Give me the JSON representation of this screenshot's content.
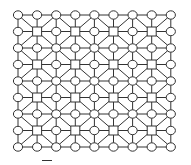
{
  "diagram": {
    "type": "grid-graph",
    "cols": 9,
    "rows": 9,
    "origin": {
      "x": 18,
      "y": 15
    },
    "spacing": {
      "x": 19.1,
      "y": 16.5
    },
    "node_shapes": {
      "circle": "all nodes except where square",
      "square": "nodes with odd column and odd row index"
    },
    "square_positions": [
      [
        1,
        1
      ],
      [
        3,
        1
      ],
      [
        5,
        1
      ],
      [
        7,
        1
      ],
      [
        1,
        3
      ],
      [
        3,
        3
      ],
      [
        5,
        3
      ],
      [
        7,
        3
      ],
      [
        1,
        5
      ],
      [
        3,
        5
      ],
      [
        5,
        5
      ],
      [
        7,
        5
      ],
      [
        1,
        7
      ],
      [
        3,
        7
      ],
      [
        5,
        7
      ],
      [
        7,
        7
      ]
    ],
    "edges": {
      "orthogonal": "every node connects to its horizontal and vertical neighbors",
      "diagonal": "every square connects to its four diagonal neighbor circles"
    },
    "circle_radius": {
      "rx": 4.6,
      "ry": 4.2
    },
    "square_size": 9,
    "stroke_color": "#333333",
    "fill_color": "#ffffff"
  },
  "caption": {
    "legible": false
  }
}
